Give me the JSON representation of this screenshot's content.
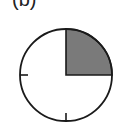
{
  "figure": {
    "label": "(b)",
    "diagram": {
      "type": "clock-face pie",
      "shaded_fraction": 0.25,
      "shaded_quadrant": "top-right",
      "ticks": [
        "left",
        "bottom"
      ],
      "colors": {
        "outline": "#1a1a1a",
        "shade": "#7a7a7a",
        "background": "#ffffff"
      }
    }
  }
}
